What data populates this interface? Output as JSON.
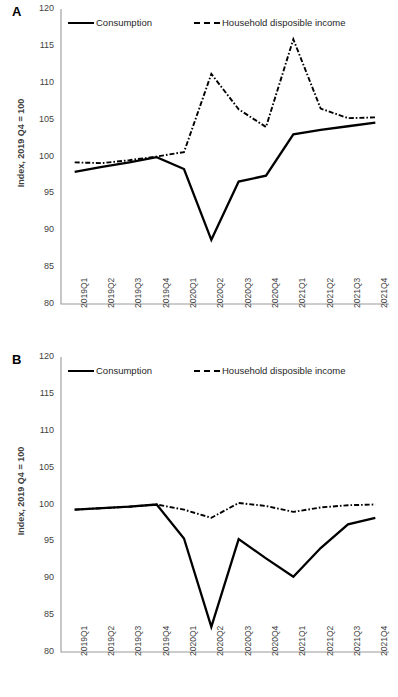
{
  "figure": {
    "panels": [
      {
        "letter": "A",
        "ylabel": "Index, 2019 Q4 = 100",
        "legend": [
          {
            "label": "Consumption",
            "style": "solid"
          },
          {
            "label": "Household disposible income",
            "style": "dash-dot"
          }
        ]
      },
      {
        "letter": "B",
        "ylabel": "Index, 2019 Q4 = 100",
        "legend": [
          {
            "label": "Consumption",
            "style": "solid"
          },
          {
            "label": "Household disposible income",
            "style": "dash-dot"
          }
        ]
      }
    ]
  },
  "chart_data": [
    {
      "type": "line",
      "panel": "A",
      "title": "",
      "xlabel": "",
      "ylabel": "Index, 2019 Q4 = 100",
      "ylim": [
        80,
        120
      ],
      "yticks": [
        80,
        85,
        90,
        95,
        100,
        105,
        110,
        115,
        120
      ],
      "grid": false,
      "legend_position": "top-inside",
      "categories": [
        "2019Q1",
        "2019Q2",
        "2019Q3",
        "2019Q4",
        "2020Q1",
        "2020Q2",
        "2020Q3",
        "2020Q4",
        "2021Q1",
        "2021Q2",
        "2021Q3",
        "2021Q4"
      ],
      "series": [
        {
          "name": "Consumption",
          "style": "solid",
          "values": [
            97.9,
            98.6,
            99.2,
            99.9,
            98.3,
            88.7,
            96.6,
            97.4,
            103.0,
            103.6,
            104.1,
            104.6
          ]
        },
        {
          "name": "Household disposible income",
          "style": "dash-dot",
          "values": [
            99.2,
            99.1,
            99.5,
            100.0,
            100.6,
            111.2,
            106.4,
            104.0,
            115.9,
            106.5,
            105.2,
            105.3
          ]
        }
      ]
    },
    {
      "type": "line",
      "panel": "B",
      "title": "",
      "xlabel": "",
      "ylabel": "Index, 2019 Q4 = 100",
      "ylim": [
        80,
        120
      ],
      "yticks": [
        80,
        85,
        90,
        95,
        100,
        105,
        110,
        115,
        120
      ],
      "grid": false,
      "legend_position": "top-inside",
      "categories": [
        "2019Q1",
        "2019Q2",
        "2019Q3",
        "2019Q4",
        "2020Q1",
        "2020Q2",
        "2020Q3",
        "2020Q4",
        "2021Q1",
        "2021Q2",
        "2021Q3",
        "2021Q4"
      ],
      "series": [
        {
          "name": "Consumption",
          "style": "solid",
          "values": [
            99.3,
            99.5,
            99.7,
            100.0,
            95.4,
            83.4,
            95.3,
            92.7,
            90.2,
            94.1,
            97.3,
            98.2
          ]
        },
        {
          "name": "Household disposible income",
          "style": "dash-dot",
          "values": [
            99.3,
            99.5,
            99.7,
            100.0,
            99.3,
            98.2,
            100.2,
            99.8,
            99.0,
            99.6,
            99.9,
            100.0
          ]
        }
      ]
    }
  ]
}
